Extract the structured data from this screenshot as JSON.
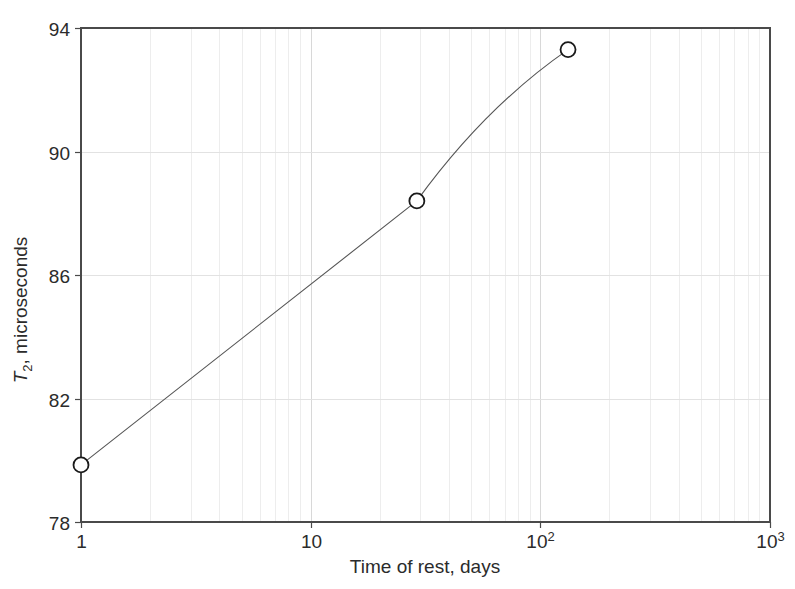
{
  "chart_data": {
    "type": "line",
    "title": "",
    "subtitle": "",
    "xlabel": "Time of rest, days",
    "ylabel": "T2, microseconds",
    "ylabel_parts": {
      "symbol": "T",
      "subscript": "2",
      "rest": ", microseconds"
    },
    "xscale": "log",
    "yscale": "linear",
    "xlim": [
      1,
      1000
    ],
    "ylim": [
      78,
      94
    ],
    "grid": true,
    "grid_minor": true,
    "legend": "none",
    "x_tick_labels": [
      "1",
      "10",
      "10²",
      "10³"
    ],
    "x_tick_values": [
      1,
      10,
      100,
      1000
    ],
    "x_tick_label_parts": [
      {
        "base": "1",
        "exp": ""
      },
      {
        "base": "10",
        "exp": ""
      },
      {
        "base": "10",
        "exp": "2"
      },
      {
        "base": "10",
        "exp": "3"
      }
    ],
    "y_tick_labels": [
      "78",
      "82",
      "86",
      "90",
      "94"
    ],
    "y_tick_values": [
      78,
      82,
      86,
      90,
      94
    ],
    "series": [
      {
        "name": "T2 vs time of rest",
        "marker": "open-circle",
        "marker_color": "#ffffff",
        "marker_edge_color": "#1a1a1a",
        "line_color": "#555555",
        "x": [
          1,
          29,
          132
        ],
        "y": [
          79.85,
          88.4,
          93.3
        ]
      }
    ],
    "colors": {
      "axis": "#4a4a4a",
      "grid_major": "#d8d8d8",
      "grid_minor": "#ededed",
      "line": "#555555",
      "marker_edge": "#1a1a1a",
      "marker_fill": "#ffffff",
      "text": "#2b2b2b",
      "background": "#ffffff"
    }
  }
}
